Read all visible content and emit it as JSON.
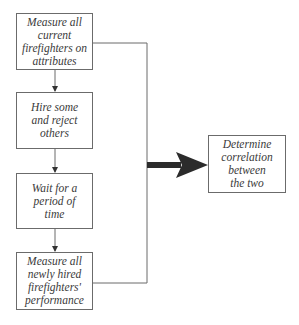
{
  "diagram": {
    "type": "flowchart",
    "steps": [
      {
        "id": "step1",
        "label": "Measure all\ncurrent\nfirefighters on\nattributes"
      },
      {
        "id": "step2",
        "label": "Hire some\nand reject\nothers"
      },
      {
        "id": "step3",
        "label": "Wait for a\nperiod of\ntime"
      },
      {
        "id": "step4",
        "label": "Measure all\nnewly hired\nfirefighters'\nperformance"
      }
    ],
    "result": {
      "id": "result",
      "label": "Determine\ncorrelation\nbetween\nthe two"
    },
    "edges": [
      {
        "from": "step1",
        "to": "step2"
      },
      {
        "from": "step2",
        "to": "step3"
      },
      {
        "from": "step3",
        "to": "step4"
      },
      {
        "from": "step1+step4",
        "to": "result",
        "style": "thick-arrow"
      }
    ],
    "colors": {
      "line": "#6b6b6b",
      "arrow": "#2b2b2b",
      "text": "#3a3a3a"
    }
  }
}
